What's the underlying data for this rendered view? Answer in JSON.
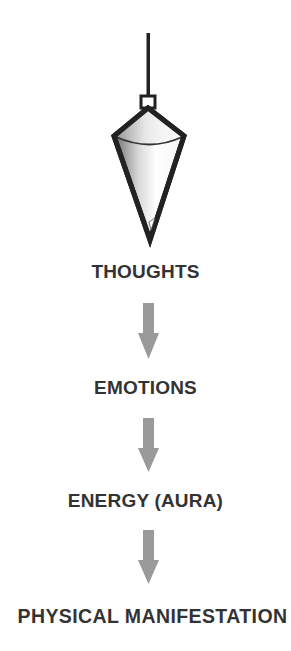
{
  "diagram": {
    "type": "flow",
    "direction": "top-to-bottom",
    "header_graphic": "pendulum-icon",
    "steps": [
      {
        "label": "THOUGHTS"
      },
      {
        "label": "EMOTIONS"
      },
      {
        "label": "ENERGY (AURA)"
      },
      {
        "label": "PHYSICAL MANIFESTATION"
      }
    ],
    "connector": "down-arrow-icon",
    "colors": {
      "text": "#333333",
      "arrow": "#9a9a9a",
      "pendulum_outline": "#222222",
      "background": "#ffffff"
    }
  }
}
